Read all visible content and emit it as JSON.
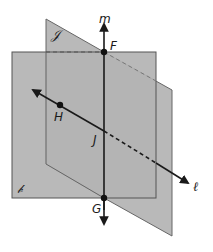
{
  "diagram": {
    "colors": {
      "background": "#ffffff",
      "plane_fill": "#b7b7b7",
      "plane_edge": "#555555",
      "line": "#1a1a1a",
      "point": "#111111"
    },
    "planes": [
      {
        "id": "plane-B",
        "label": "𝒷"
      },
      {
        "id": "plane-J",
        "label": "𝒥"
      }
    ],
    "lines": [
      {
        "id": "line-m",
        "label": "m"
      },
      {
        "id": "line-l",
        "label": "ℓ"
      }
    ],
    "points": [
      {
        "id": "point-F",
        "label": "F"
      },
      {
        "id": "point-G",
        "label": "G"
      },
      {
        "id": "point-H",
        "label": "H"
      },
      {
        "id": "point-J",
        "label": "J"
      }
    ]
  }
}
